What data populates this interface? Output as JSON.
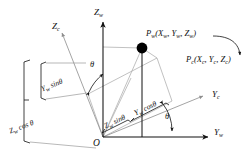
{
  "figure": {
    "type": "geometry-diagram",
    "background_color": "#ffffff",
    "line_color": "#111111",
    "light_line_color": "#9a9a9a",
    "point_color": "#000000"
  },
  "axes": {
    "z_world": {
      "label": "Z",
      "subscript": "w"
    },
    "y_world": {
      "label": "Y",
      "subscript": "w"
    },
    "z_camera": {
      "label": "Z",
      "subscript": "c"
    },
    "y_camera": {
      "label": "Y",
      "subscript": "c"
    },
    "origin": {
      "label": "O"
    }
  },
  "points": {
    "p_world": {
      "text": "P",
      "subscript": "w",
      "coords": "(X",
      "full": "Pw(Xw, Yw, Zw)"
    },
    "p_camera": {
      "text": "P",
      "subscript": "c",
      "full": "Pc(Xc, Yc, Zc)"
    }
  },
  "point_labels": {
    "world": {
      "name": "P",
      "name_sub": "w",
      "open": "(",
      "x": "X",
      "x_sub": "w",
      "c1": ", ",
      "y": "Y",
      "y_sub": "w",
      "c2": ", ",
      "z": "Z",
      "z_sub": "w",
      "close": ")"
    },
    "camera": {
      "name": "P",
      "name_sub": "c",
      "open": "(",
      "x": "X",
      "x_sub": "c",
      "c1": ", ",
      "y": "Y",
      "y_sub": "c",
      "c2": ", ",
      "z": "Z",
      "z_sub": "c",
      "close": ")"
    }
  },
  "components": {
    "yw_sin": {
      "base": "Y",
      "sub": "w",
      "fn": " sin",
      "angle": "θ"
    },
    "zw_cos": {
      "base": "Z",
      "sub": "w",
      "fn": " cos ",
      "angle": "θ"
    },
    "zw_sin": {
      "base": "Z",
      "sub": "w",
      "fn": " sin",
      "angle": "θ"
    },
    "yw_cos": {
      "base": "Y",
      "sub": "w",
      "fn": " cos",
      "angle": "θ"
    }
  },
  "angles": {
    "upper": "θ",
    "lower": "θ"
  }
}
